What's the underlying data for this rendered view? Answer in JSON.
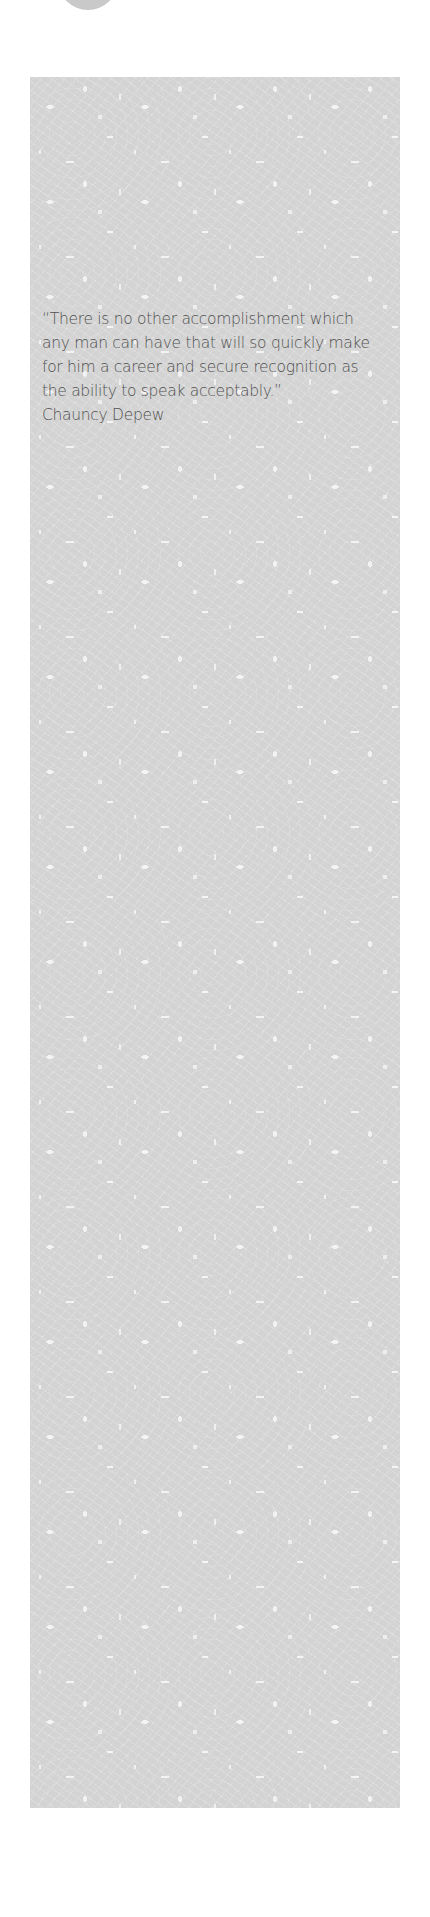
{
  "quote": {
    "text": "“There is no other accomplishment which any man can have that will so quickly make for him a career and secure recognition as the ability to speak acceptably.”",
    "author": "Chauncy Depew"
  },
  "colors": {
    "panel_background": "#d3d3d3",
    "text": "#505050",
    "circle": "#c9c9c9"
  }
}
